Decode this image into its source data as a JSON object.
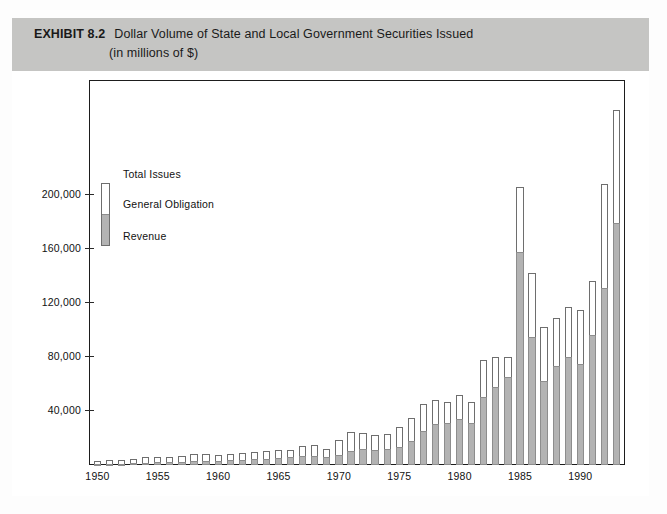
{
  "header": {
    "exhibit_label": "EXHIBIT 8.2",
    "title_line_1": "Dollar Volume of State and Local Government Securities Issued",
    "title_line_2": "(in millions of $)"
  },
  "legend": {
    "total_label": "Total Issues",
    "general_obligation_label": "General Obligation",
    "revenue_label": "Revenue",
    "general_obligation_color": "#ffffff",
    "revenue_color": "#b3b3b3",
    "outline_color": "#6e6e6e"
  },
  "chart_data": {
    "type": "bar",
    "stacked": true,
    "title": "Dollar Volume of State and Local Government Securities Issued",
    "subtitle": "(in millions of $)",
    "xlabel": "",
    "ylabel": "",
    "grid": false,
    "legend_position": "inside-upper-left",
    "xlim": [
      1949.3,
      1993.7
    ],
    "ylim": [
      0,
      285000
    ],
    "ytick_labels": [
      "40,000",
      "80,000",
      "120,000",
      "160,000",
      "200,000"
    ],
    "ytick_values": [
      40000,
      80000,
      120000,
      160000,
      200000
    ],
    "xtick_labels": [
      "1950",
      "1955",
      "1960",
      "1965",
      "1970",
      "1975",
      "1980",
      "1985",
      "1990"
    ],
    "xtick_values": [
      1950,
      1955,
      1960,
      1965,
      1970,
      1975,
      1980,
      1985,
      1990
    ],
    "categories": [
      1950,
      1951,
      1952,
      1953,
      1954,
      1955,
      1956,
      1957,
      1958,
      1959,
      1960,
      1961,
      1962,
      1963,
      1964,
      1965,
      1966,
      1967,
      1968,
      1969,
      1970,
      1971,
      1972,
      1973,
      1974,
      1975,
      1976,
      1977,
      1978,
      1979,
      1980,
      1981,
      1982,
      1983,
      1984,
      1985,
      1986,
      1987,
      1988,
      1989,
      1990,
      1991,
      1992,
      1993
    ],
    "series": [
      {
        "name": "Revenue",
        "color": "#b3b3b3",
        "values": [
          600,
          800,
          900,
          1200,
          1600,
          2000,
          2200,
          2400,
          2800,
          3100,
          3300,
          3600,
          3900,
          4400,
          4800,
          5200,
          5600,
          6800,
          7000,
          5900,
          7400,
          10500,
          11500,
          11000,
          11500,
          13500,
          18000,
          25000,
          30000,
          31000,
          34000,
          31000,
          50000,
          58000,
          65000,
          158000,
          95000,
          62000,
          73000,
          80000,
          75000,
          96000,
          131000,
          179000
        ]
      },
      {
        "name": "General Obligation",
        "color": "#ffffff",
        "values": [
          2200,
          2600,
          3000,
          3600,
          4200,
          4000,
          3400,
          4000,
          5200,
          4700,
          4400,
          4900,
          5000,
          5300,
          5500,
          5700,
          5200,
          7500,
          7600,
          5700,
          10900,
          14100,
          12500,
          11200,
          11700,
          15000,
          17000,
          20000,
          18000,
          15500,
          18000,
          16000,
          28000,
          22000,
          15000,
          48000,
          47000,
          40000,
          36000,
          37000,
          40000,
          40000,
          77000,
          84000
        ]
      }
    ],
    "totals": [
      2800,
      3400,
      3900,
      4800,
      5800,
      6000,
      5600,
      6400,
      8000,
      7800,
      7700,
      8500,
      8900,
      9700,
      10300,
      10900,
      10800,
      14300,
      14600,
      11600,
      18300,
      24600,
      24000,
      22200,
      23200,
      28500,
      35000,
      45000,
      48000,
      46500,
      52000,
      47000,
      78000,
      80000,
      80000,
      206000,
      142000,
      102000,
      109000,
      117000,
      115000,
      136000,
      208000,
      263000
    ]
  }
}
